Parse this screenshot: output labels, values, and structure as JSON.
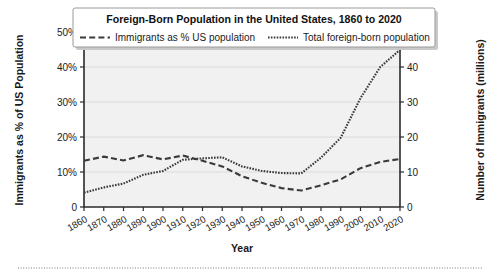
{
  "chart_data": {
    "type": "line",
    "title": "Foreign-Born Population in the United States, 1860 to 2020",
    "xlabel": "Year",
    "ylabel": "Immigrants as % of US Population",
    "ylabel_right": "Number of Immigrants (millions)",
    "grid": true,
    "legend_position": "top-inside-title-box",
    "x": [
      1860,
      1870,
      1880,
      1890,
      1900,
      1910,
      1920,
      1930,
      1940,
      1950,
      1960,
      1970,
      1980,
      1990,
      2000,
      2010,
      2020
    ],
    "xtick_labels": [
      "1860",
      "1870",
      "1880",
      "1890",
      "1900",
      "1910",
      "1920",
      "1930",
      "1940",
      "1950",
      "1960",
      "1970",
      "1980",
      "1990",
      "2000",
      "2010",
      "2020"
    ],
    "xlim": [
      1860,
      2020
    ],
    "ylim": [
      0,
      50
    ],
    "ytick_labels": [
      "0",
      "10%",
      "20%",
      "30%",
      "40%",
      "50%"
    ],
    "ytick_values": [
      0,
      10,
      20,
      30,
      40,
      50
    ],
    "ylim_right": [
      0,
      50
    ],
    "ytick_labels_right": [
      "0",
      "10",
      "20",
      "30",
      "40",
      "50"
    ],
    "ytick_values_right": [
      0,
      10,
      20,
      30,
      40,
      50
    ],
    "series": [
      {
        "name": "Immigrants as % US population",
        "axis": "left",
        "unit": "%",
        "style": "dashed",
        "values": [
          13.2,
          14.4,
          13.3,
          14.8,
          13.6,
          14.7,
          13.2,
          11.6,
          8.8,
          6.9,
          5.4,
          4.7,
          6.2,
          7.9,
          11.1,
          12.9,
          13.7
        ]
      },
      {
        "name": "Total foreign-born population",
        "axis": "right",
        "unit": "millions",
        "style": "dotted",
        "values": [
          4.1,
          5.6,
          6.7,
          9.2,
          10.3,
          13.5,
          13.9,
          14.2,
          11.6,
          10.3,
          9.7,
          9.6,
          14.1,
          19.8,
          31.1,
          40.0,
          44.9
        ]
      }
    ]
  },
  "legend": {
    "items": [
      {
        "label": "Immigrants as % US population",
        "style": "dashed"
      },
      {
        "label": "Total foreign-born population",
        "style": "dotted"
      }
    ]
  }
}
